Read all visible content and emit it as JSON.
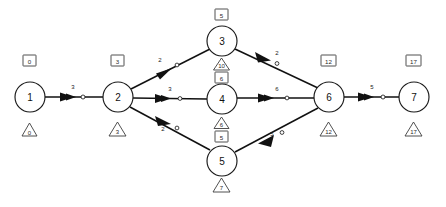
{
  "diagram": {
    "type": "project-network",
    "nodes": [
      {
        "id": "1",
        "label": "1",
        "cx": 30,
        "cy": 97,
        "r": 15,
        "early": "0",
        "late": "0",
        "early_y": 62,
        "late_y": 131
      },
      {
        "id": "2",
        "label": "2",
        "cx": 118,
        "cy": 97,
        "r": 15,
        "early": "3",
        "late": "3",
        "early_y": 62,
        "late_y": 131
      },
      {
        "id": "3",
        "label": "3",
        "cx": 222,
        "cy": 41,
        "r": 15,
        "early": "5",
        "late": "10",
        "early_y": 15,
        "late_y": 64
      },
      {
        "id": "4",
        "label": "4",
        "cx": 222,
        "cy": 99,
        "r": 15,
        "early": "6",
        "late": "6",
        "early_y": 77,
        "late_y": 124
      },
      {
        "id": "5",
        "label": "5",
        "cx": 222,
        "cy": 161,
        "r": 15,
        "early": "5",
        "late": "7",
        "early_y": 137,
        "late_y": 185
      },
      {
        "id": "6",
        "label": "6",
        "cx": 329,
        "cy": 97,
        "r": 15,
        "early": "12",
        "late": "12",
        "early_y": 62,
        "late_y": 131
      },
      {
        "id": "7",
        "label": "7",
        "cx": 414,
        "cy": 97,
        "r": 15,
        "early": "17",
        "late": "17",
        "early_y": 62,
        "late_y": 131
      }
    ],
    "edges": [
      {
        "id": "e1",
        "from": "1",
        "to": "2",
        "weight": "3",
        "wx": 73,
        "wy": 89
      },
      {
        "id": "e2",
        "from": "2",
        "to": "3",
        "weight": "2",
        "wx": 160,
        "wy": 62
      },
      {
        "id": "e3",
        "from": "2",
        "to": "4",
        "weight": "3",
        "wx": 170,
        "wy": 91
      },
      {
        "id": "e4",
        "from": "2",
        "to": "5",
        "weight": "2",
        "wx": 163,
        "wy": 131
      },
      {
        "id": "e5",
        "from": "3",
        "to": "6",
        "weight": "2",
        "wx": 277,
        "wy": 55
      },
      {
        "id": "e6",
        "from": "4",
        "to": "6",
        "weight": "6",
        "wx": 277,
        "wy": 91
      },
      {
        "id": "e7",
        "from": "5",
        "to": "6",
        "weight": "5",
        "wx": 276,
        "wy": 136
      },
      {
        "id": "e8",
        "from": "6",
        "to": "7",
        "weight": "5",
        "wx": 372,
        "wy": 89
      }
    ],
    "colors": {
      "background": "#ffffff",
      "stroke": "#111111",
      "marker_stroke": "#3d3d3d",
      "text": "#2b2b2b"
    }
  }
}
